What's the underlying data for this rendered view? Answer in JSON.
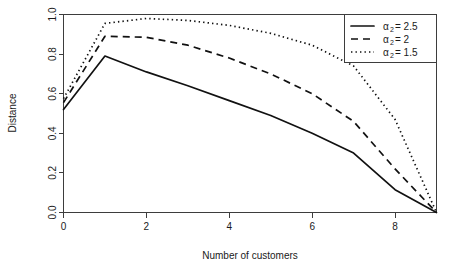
{
  "chart_data": {
    "type": "line",
    "title": "",
    "xlabel": "Number of customers",
    "ylabel": "Distance",
    "xlim": [
      0,
      9
    ],
    "ylim": [
      0,
      1.0
    ],
    "grid": false,
    "legend_position": "top-right",
    "x": [
      0,
      1,
      2,
      3,
      4,
      5,
      6,
      7,
      8,
      9
    ],
    "xticks": [
      "0",
      "2",
      "4",
      "6",
      "8"
    ],
    "xtick_values": [
      0,
      2,
      4,
      6,
      8
    ],
    "yticks": [
      "0.0",
      "0.2",
      "0.4",
      "0.6",
      "0.8",
      "1.0"
    ],
    "ytick_values": [
      0.0,
      0.2,
      0.4,
      0.6,
      0.8,
      1.0
    ],
    "series": [
      {
        "name": "alpha_2 = 2.5",
        "legend_label": "= 2.5",
        "legend_symbol": "α",
        "legend_subscript": "2",
        "linestyle": "solid",
        "color": "#111111",
        "values": [
          0.52,
          0.79,
          0.71,
          0.64,
          0.565,
          0.49,
          0.4,
          0.3,
          0.115,
          0.0
        ]
      },
      {
        "name": "alpha_2 = 2",
        "legend_label": "= 2",
        "legend_symbol": "α",
        "legend_subscript": "2",
        "linestyle": "dashed",
        "color": "#111111",
        "values": [
          0.555,
          0.89,
          0.885,
          0.845,
          0.78,
          0.7,
          0.6,
          0.46,
          0.22,
          0.0
        ]
      },
      {
        "name": "alpha_2 = 1.5",
        "legend_label": "= 1.5",
        "legend_symbol": "α",
        "legend_subscript": "2",
        "linestyle": "dotted",
        "color": "#111111",
        "values": [
          0.575,
          0.955,
          0.98,
          0.97,
          0.945,
          0.905,
          0.845,
          0.74,
          0.47,
          0.0
        ]
      }
    ]
  },
  "figure": {
    "background_color": "#ffffff",
    "axis_color": "#3d3d3d",
    "text_color": "#1a1a1a"
  }
}
